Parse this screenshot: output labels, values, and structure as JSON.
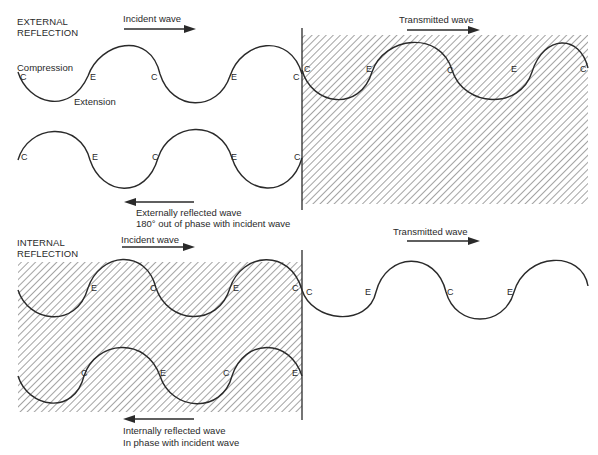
{
  "external": {
    "section_title_line1": "EXTERNAL",
    "section_title_line2": "REFLECTION",
    "incident_label": "Incident wave",
    "transmitted_label": "Transmitted wave",
    "reflected_label_line1": "Externally reflected wave",
    "reflected_label_line2": "180° out of phase with incident wave",
    "compression_label": "Compression",
    "extension_label": "Extension",
    "incident_points": [
      "C",
      "E",
      "C",
      "E",
      "C"
    ],
    "transmitted_points": [
      "C",
      "E",
      "C",
      "E",
      "C"
    ],
    "reflected_points": [
      "C",
      "E",
      "C",
      "E",
      "C"
    ]
  },
  "internal": {
    "section_title_line1": "INTERNAL",
    "section_title_line2": "REFLECTION",
    "incident_label": "Incident wave",
    "transmitted_label": "Transmitted wave",
    "reflected_label_line1": "Internally reflected wave",
    "reflected_label_line2": "In phase with incident wave",
    "incident_points": [
      "E",
      "C",
      "E",
      "C"
    ],
    "transmitted_points": [
      "C",
      "E",
      "C",
      "E"
    ],
    "reflected_points": [
      "C",
      "E",
      "C",
      "E"
    ]
  },
  "colors": {
    "line": "#2a2a2a",
    "hatch": "#555555",
    "background": "#ffffff"
  }
}
